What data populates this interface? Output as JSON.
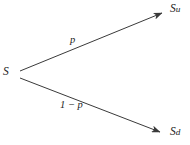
{
  "diagram": {
    "type": "one-step-binomial-tree",
    "background_color": "#ffffff",
    "stroke_color": "#3a3a3a",
    "text_color": "#1a1a1a",
    "nodes": {
      "root": {
        "label": "S",
        "x": 14,
        "y": 74
      },
      "up": {
        "label_base": "S",
        "label_sub": "u",
        "label_full": "Su",
        "x": 167,
        "y": 11
      },
      "down": {
        "label_base": "S",
        "label_sub": "d",
        "label_full": "Sd",
        "x": 165,
        "y": 134
      }
    },
    "edges": [
      {
        "name": "up-branch",
        "from": "root",
        "to": "up",
        "label": "p",
        "x1": 20,
        "y1": 71,
        "x2": 167,
        "y2": 11
      },
      {
        "name": "down-branch",
        "from": "root",
        "to": "down",
        "label": "1 − p",
        "x1": 20,
        "y1": 78,
        "x2": 165,
        "y2": 134
      }
    ]
  }
}
